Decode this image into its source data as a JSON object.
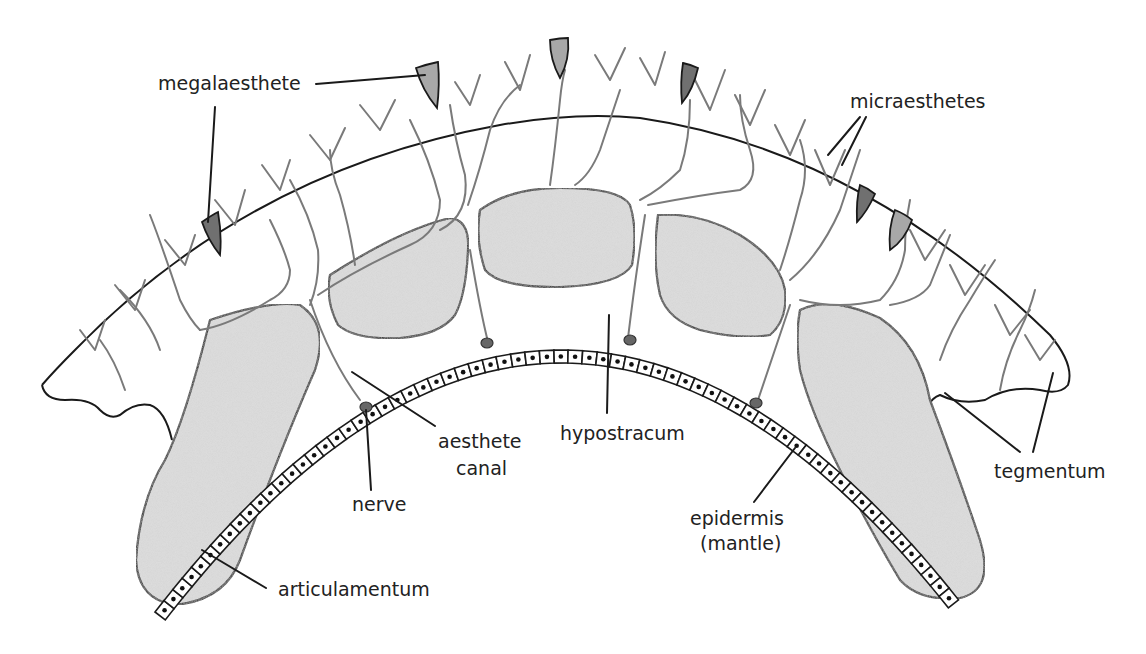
{
  "diagram": {
    "labels": {
      "megalaesthete": "megalaesthete",
      "micraesthetes": "micraesthetes",
      "aesthete_canal_line1": "aesthete",
      "aesthete_canal_line2": "canal",
      "hypostracum": "hypostracum",
      "nerve": "nerve",
      "epidermis_line1": "epidermis",
      "epidermis_line2": "(mantle)",
      "tegmentum": "tegmentum",
      "articulamentum": "articulamentum"
    },
    "colors": {
      "outline": "#1a1a1a",
      "canal": "#7a7a7a",
      "plate_fill": "#d6d6d6",
      "megalaesthete_dark": "#707070",
      "megalaesthete_light": "#a8a8a8",
      "nerve_node": "#666666",
      "background": "#ffffff"
    }
  }
}
